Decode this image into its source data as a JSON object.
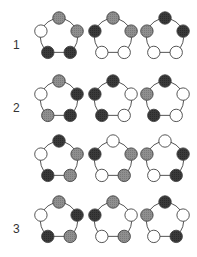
{
  "colors": {
    "white": "#ffffff",
    "gray": "#8f8f8f",
    "dark": "#3a3a3a",
    "edge": "#555555",
    "stroke": "#444444"
  },
  "node_order": [
    "top",
    "right",
    "bottom-right",
    "bottom-left",
    "left"
  ],
  "rows": [
    {
      "label": "1",
      "pentagons": [
        [
          "gray",
          "gray",
          "dark",
          "dark",
          "white"
        ],
        [
          "gray",
          "gray",
          "white",
          "white",
          "dark"
        ],
        [
          "dark",
          "dark",
          "white",
          "white",
          "gray"
        ]
      ]
    },
    {
      "label": "2",
      "pentagons": [
        [
          "gray",
          "dark",
          "dark",
          "gray",
          "white"
        ],
        [
          "dark",
          "white",
          "white",
          "dark",
          "dark"
        ],
        [
          "dark",
          "white",
          "white",
          "dark",
          "gray"
        ]
      ]
    },
    {
      "label": "",
      "pentagons": [
        [
          "dark",
          "gray",
          "gray",
          "dark",
          "white"
        ],
        [
          "white",
          "gray",
          "gray",
          "white",
          "dark"
        ],
        [
          "white",
          "dark",
          "dark",
          "white",
          "gray"
        ]
      ]
    },
    {
      "label": "3",
      "pentagons": [
        [
          "gray",
          "dark",
          "gray",
          "dark",
          "white"
        ],
        [
          "gray",
          "white",
          "gray",
          "white",
          "dark"
        ],
        [
          "dark",
          "white",
          "dark",
          "white",
          "gray"
        ]
      ]
    }
  ]
}
